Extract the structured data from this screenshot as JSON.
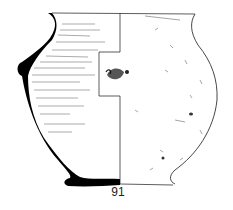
{
  "figure": {
    "number_label": "91",
    "colors": {
      "section_fill": "#000000",
      "line": "#333333",
      "background": "#ffffff"
    }
  }
}
